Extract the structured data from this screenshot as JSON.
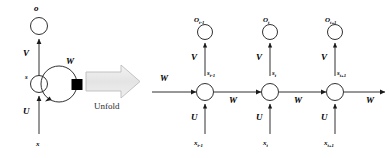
{
  "figure": {
    "type": "rnn-unfold-diagram",
    "colors": {
      "stroke": "#1a1a1a",
      "delay_square": "#000000",
      "unfold_arrow_fill": "#e8e8e8",
      "unfold_arrow_stroke": "#b9b9b9",
      "background": "#ffffff"
    }
  },
  "folded": {
    "output_label": "o",
    "state_label": "s",
    "input_label": "x",
    "weight_output": "V",
    "weight_input": "U",
    "weight_recurrent": "W",
    "delay_element": "delay-square"
  },
  "unfold": {
    "caption": "Unfold",
    "arrow": "block-arrow-right"
  },
  "unfolded": {
    "incoming_weight": "W",
    "outgoing_weight": "W",
    "steps": [
      {
        "output": "O",
        "output_sub": "t-1",
        "state": "s",
        "state_sub": "t-1",
        "input": "x",
        "input_sub": "t-1",
        "weight_output": "V",
        "weight_input": "U",
        "weight_recurrent": "W"
      },
      {
        "output": "O",
        "output_sub": "t",
        "state": "s",
        "state_sub": "t",
        "input": "x",
        "input_sub": "t",
        "weight_output": "V",
        "weight_input": "U",
        "weight_recurrent": "W"
      },
      {
        "output": "O",
        "output_sub": "t+1",
        "state": "s",
        "state_sub": "t+1",
        "input": "x",
        "input_sub": "t+1",
        "weight_output": "V",
        "weight_input": "U",
        "weight_recurrent": "W"
      }
    ]
  }
}
